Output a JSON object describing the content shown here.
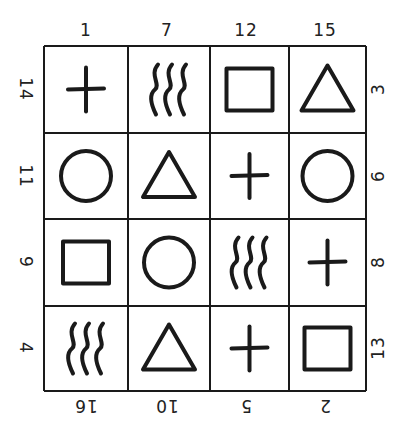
{
  "puzzle": {
    "top_labels": [
      "1",
      "7",
      "12",
      "15"
    ],
    "bottom_labels": [
      "16",
      "10",
      "5",
      "2"
    ],
    "left_labels": [
      "14",
      "11",
      "9",
      "4"
    ],
    "right_labels": [
      "3",
      "6",
      "8",
      "13"
    ],
    "grid": [
      [
        "plus",
        "waves",
        "square",
        "triangle"
      ],
      [
        "circle",
        "triangle",
        "plus",
        "circle"
      ],
      [
        "square",
        "circle",
        "waves",
        "plus"
      ],
      [
        "waves",
        "triangle",
        "plus",
        "square"
      ]
    ],
    "line_color": "#1a1a1a"
  }
}
